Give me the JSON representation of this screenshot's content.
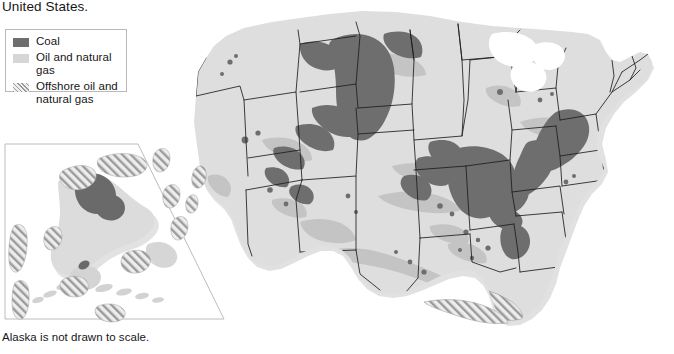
{
  "page": {
    "title_fragment": "United States.",
    "footnote": "Alaska is not drawn to scale.",
    "width": 674,
    "height": 354
  },
  "legend": {
    "box": {
      "x": 5,
      "y": 29,
      "width": 122,
      "height": 63
    },
    "items": [
      {
        "id": "coal",
        "label": "Coal",
        "swatch": "solid-dark-gray",
        "color": "#6e6e6e"
      },
      {
        "id": "oil-gas",
        "label": "Oil and natural gas",
        "swatch": "solid-light-gray",
        "color": "#d6d6d6"
      },
      {
        "id": "offshore",
        "label": "Offshore oil and natural gas",
        "swatch": "diagonal-hatch",
        "color": "#9a9a9a"
      }
    ]
  },
  "inset": {
    "name": "alaska-inset",
    "note": "Alaska is not drawn to scale.",
    "frame": {
      "x": 4,
      "y": 141,
      "width": 220,
      "height": 178
    }
  },
  "colors": {
    "land": "#dcdcdc",
    "coal": "#6e6e6e",
    "oil_gas": "#c6c6c6",
    "offshore_hatch": "#9a9a9a",
    "state_border": "#1d1d1d",
    "coast_shadow": "#bdbdbd",
    "background": "#ffffff",
    "legend_border": "#b9b9b9",
    "text": "#161616"
  },
  "map": {
    "title": "Energy resources of the United States",
    "regions": [
      {
        "name": "main-us-map",
        "description": "contiguous United States with state boundaries"
      },
      {
        "name": "alaska-inset",
        "description": "Alaska, not drawn to scale"
      }
    ],
    "resource_areas": [
      {
        "type": "coal",
        "region": "Powder River Basin",
        "states": [
          "Montana",
          "Wyoming"
        ]
      },
      {
        "type": "coal",
        "region": "Green River / Uinta Basin",
        "states": [
          "Wyoming",
          "Utah",
          "Colorado"
        ]
      },
      {
        "type": "coal",
        "region": "Illinois Basin",
        "states": [
          "Illinois",
          "Indiana",
          "Kentucky"
        ]
      },
      {
        "type": "coal",
        "region": "Appalachian Basin",
        "states": [
          "Pennsylvania",
          "West Virginia",
          "Kentucky",
          "Virginia"
        ]
      },
      {
        "type": "coal",
        "region": "Warrior Basin",
        "states": [
          "Alabama"
        ]
      },
      {
        "type": "coal",
        "region": "North Slope",
        "states": [
          "Alaska"
        ]
      },
      {
        "type": "oil_gas",
        "region": "Gulf Coast",
        "states": [
          "Texas",
          "Louisiana",
          "Mississippi"
        ]
      },
      {
        "type": "oil_gas",
        "region": "Permian Basin",
        "states": [
          "Texas",
          "New Mexico"
        ]
      },
      {
        "type": "oil_gas",
        "region": "Mid-Continent",
        "states": [
          "Oklahoma",
          "Kansas"
        ]
      },
      {
        "type": "oil_gas",
        "region": "Appalachian",
        "states": [
          "Pennsylvania",
          "Ohio",
          "West Virginia"
        ]
      },
      {
        "type": "offshore",
        "region": "Gulf of Mexico",
        "states": [
          "Texas",
          "Louisiana"
        ]
      },
      {
        "type": "offshore",
        "region": "Pacific Coast",
        "states": [
          "California"
        ]
      },
      {
        "type": "offshore",
        "region": "Arctic / Bering",
        "states": [
          "Alaska"
        ]
      }
    ]
  }
}
